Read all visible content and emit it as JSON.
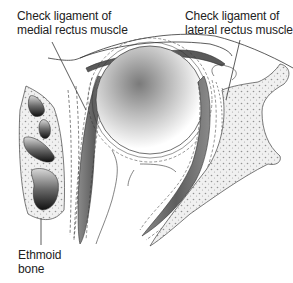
{
  "diagram": {
    "labels": {
      "medial_check_ligament": {
        "line1": "Check ligament of",
        "line2": "medial rectus muscle"
      },
      "lateral_check_ligament": {
        "line1": "Check ligament of",
        "line2": "lateral rectus muscle"
      },
      "ethmoid_bone": {
        "line1": "Ethmoid",
        "line2": "bone"
      }
    },
    "structures": [
      "eyeball",
      "medial-rectus-muscle",
      "lateral-rectus-muscle",
      "ethmoid-air-cells",
      "lateral-orbital-wall",
      "eyelid",
      "tenon-capsule"
    ],
    "colors": {
      "outline": "#333333",
      "muscle": "#6f6f6f",
      "bone_fill": "#f2f2f2",
      "sinus_dark": "#2a2a2a",
      "eyeball_center": "#7a7a7a"
    }
  }
}
